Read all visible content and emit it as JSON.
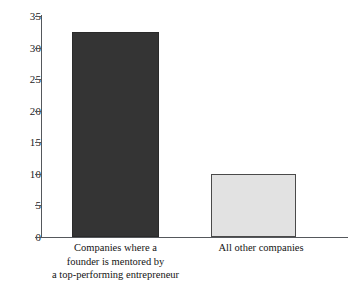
{
  "chart_data": {
    "type": "bar",
    "title": "",
    "subtitle": "",
    "xlabel": "",
    "ylabel": "",
    "categories": [
      "Companies where a\nfounder is mentored by\na top-performing entrepreneur",
      "All other companies"
    ],
    "values": [
      32.5,
      10
    ],
    "ylim": [
      0,
      35
    ],
    "ytick_values": [
      0,
      5,
      10,
      15,
      20,
      25,
      30,
      35
    ],
    "ytick_labels": [
      "0",
      "5",
      "10",
      "15",
      "20",
      "25",
      "30",
      "35"
    ],
    "grid": false,
    "legend": false,
    "legend_position": "none",
    "bar_colors": [
      "#343434",
      "#e2e2e2"
    ],
    "bar_border_colors": [
      "#2a2a2a",
      "#4a4a4a"
    ],
    "axis_color": "#55585c"
  },
  "axis": {
    "ticks": [
      {
        "label": "35",
        "value": 35
      },
      {
        "label": "30",
        "value": 30
      },
      {
        "label": "25",
        "value": 25
      },
      {
        "label": "20",
        "value": 20
      },
      {
        "label": "15",
        "value": 15
      },
      {
        "label": "10",
        "value": 10
      },
      {
        "label": "5",
        "value": 5
      },
      {
        "label": "0",
        "value": 0
      }
    ]
  },
  "bars": [
    {
      "label": "Companies where a\nfounder is mentored by\na top-performing entrepreneur",
      "value": 32.5
    },
    {
      "label": "All other companies",
      "value": 10
    }
  ]
}
